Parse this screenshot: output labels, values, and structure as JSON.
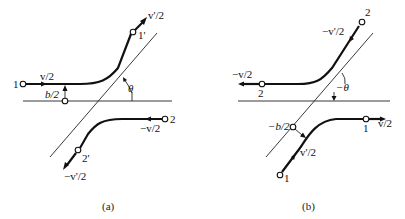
{
  "figure": {
    "panel_a": {
      "caption": "(a)",
      "labels": {
        "node_1": "1",
        "node_1_prime": "1'",
        "node_2": "2",
        "node_2_prime": "2'",
        "v_in": "v/2",
        "v_out": "v'/2",
        "v2_in": "−v/2",
        "v2_out": "−v'/2",
        "impact": "b/2",
        "angle": "θ"
      }
    },
    "panel_b": {
      "caption": "(b)",
      "labels": {
        "node_2_top": "2",
        "node_2_left": "2",
        "node_1_bottom": "1",
        "node_1_right": "1",
        "v_top": "−v'/2",
        "v_left": "−v/2",
        "v_bottom": "v'/2",
        "v_right": "v/2",
        "impact": "−b/2",
        "angle": "−θ"
      }
    }
  }
}
